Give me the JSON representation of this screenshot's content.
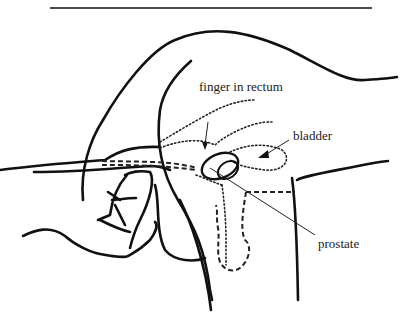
{
  "figure": {
    "type": "anatomical line drawing",
    "labels": [
      {
        "id": "finger",
        "text": "finger in rectum"
      },
      {
        "id": "bladder",
        "text": "bladder"
      },
      {
        "id": "prostate",
        "text": "prostate"
      }
    ]
  },
  "colors": {
    "line": "#111111",
    "background": "#ffffff"
  }
}
